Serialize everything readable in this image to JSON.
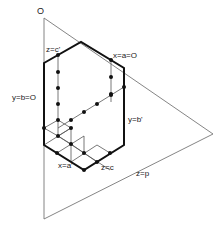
{
  "diagram": {
    "type": "crystallographic plane / isometric construction",
    "colors": {
      "thin_line": "#777777",
      "bold_line": "#111111",
      "dot": "#111111",
      "text": "#222222",
      "background": "#ffffff"
    },
    "labels": {
      "origin": "O",
      "top_left_edge": "z=c'",
      "top_right_edge": "x=a=O",
      "left_edge": "y=b=O",
      "right_edge": "y=b'",
      "bottom_left_edge": "x=a'",
      "bottom_right_edge": "z=c",
      "triangle_base": "z=p"
    },
    "triangle": {
      "apex": [
        44,
        18
      ],
      "right": [
        213,
        134
      ],
      "bottom": [
        44,
        219
      ]
    },
    "hexagon": [
      [
        44,
        63
      ],
      [
        81,
        42
      ],
      [
        124,
        68
      ],
      [
        124,
        145
      ],
      [
        84,
        170
      ],
      [
        44,
        145
      ]
    ]
  }
}
